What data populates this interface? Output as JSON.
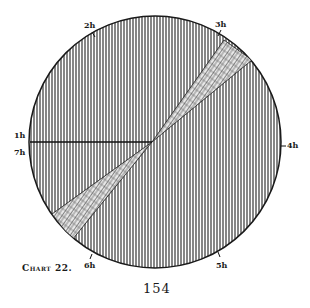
{
  "figure": {
    "caption": "Chart 22.",
    "page_number": "154",
    "circle": {
      "cx": 155,
      "cy": 142,
      "r": 126,
      "hatch": "vertical-lines"
    },
    "hour_labels": [
      {
        "id": "1h",
        "text": "1h",
        "x": 14,
        "y": 131
      },
      {
        "id": "7h",
        "text": "7h",
        "x": 14,
        "y": 149
      },
      {
        "id": "2h",
        "text": "2h",
        "x": 84,
        "y": 22
      },
      {
        "id": "3h",
        "text": "3h",
        "x": 215,
        "y": 22
      },
      {
        "id": "4h",
        "text": "4h",
        "x": 284,
        "y": 139
      },
      {
        "id": "5h",
        "text": "5h",
        "x": 216,
        "y": 263
      },
      {
        "id": "6h",
        "text": "6h",
        "x": 84,
        "y": 263
      }
    ],
    "horizontal_line": {
      "from": [
        30,
        142
      ],
      "to": [
        152,
        142
      ]
    },
    "wedge": {
      "fill": "cross-hatched",
      "points": "152,142 228,45 248,64 152,142 70,236 55,216"
    },
    "colors": {
      "ink": "#1a1a1a",
      "paper": "#ffffff"
    }
  }
}
